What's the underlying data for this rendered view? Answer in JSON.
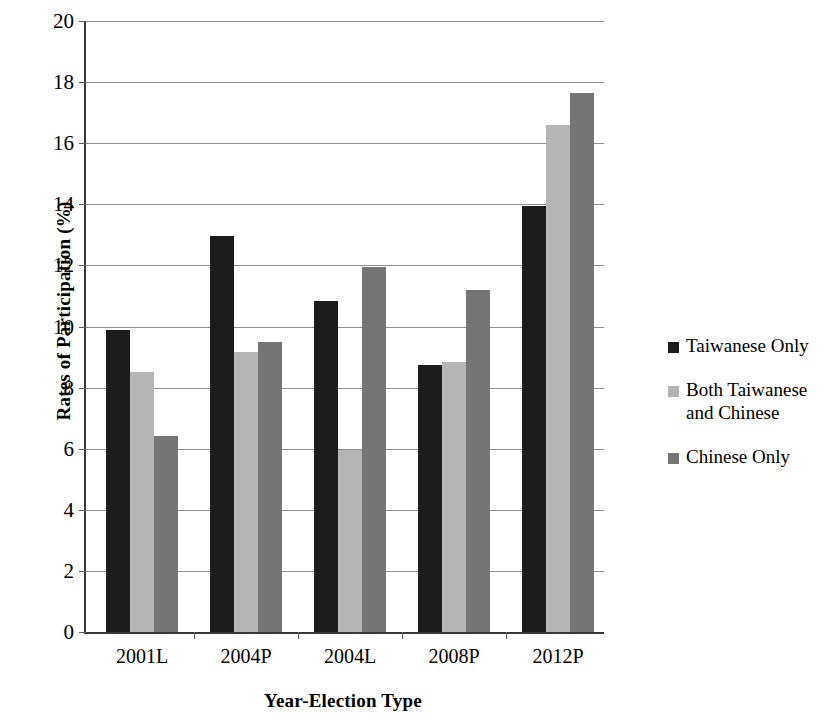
{
  "chart_data": {
    "type": "bar",
    "title": "",
    "xlabel": "Year-Election Type",
    "ylabel": "Rates of Participation (%)",
    "categories": [
      "2001L",
      "2004P",
      "2004L",
      "2008P",
      "2012P"
    ],
    "series": [
      {
        "name": "Taiwanese Only",
        "color": "#1c1c1c",
        "values": [
          9.9,
          12.95,
          10.85,
          8.75,
          13.95
        ]
      },
      {
        "name": "Both Taiwanese and Chinese",
        "color": "#b5b5b5",
        "values": [
          8.5,
          9.15,
          5.95,
          8.85,
          16.6
        ]
      },
      {
        "name": "Chinese Only",
        "color": "#757575",
        "values": [
          6.4,
          9.5,
          11.95,
          11.2,
          17.65
        ]
      }
    ],
    "ylim": [
      0,
      20
    ],
    "yticks": [
      0,
      2,
      4,
      6,
      8,
      10,
      12,
      14,
      16,
      18,
      20
    ],
    "ytick_labels": [
      "0",
      "2",
      "4",
      "6",
      "8",
      "10",
      "12",
      "14",
      "16",
      "18",
      "20"
    ],
    "grid": true,
    "grid_axis": "y",
    "legend_position": "right",
    "legend_labels": [
      "Taiwanese Only",
      "Both Taiwanese\nand Chinese",
      "Chinese Only"
    ]
  },
  "axes": {
    "y_title": "Rates of Participation (%)",
    "x_title": "Year-Election Type"
  }
}
